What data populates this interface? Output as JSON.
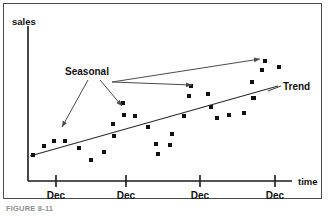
{
  "figure": {
    "caption": "FIGURE 8-11",
    "border_color": "#4a4a4a",
    "background_color": "#ffffff"
  },
  "chart_data": {
    "type": "scatter",
    "title": "",
    "xlabel": "time",
    "ylabel": "sales",
    "grid": false,
    "legend": "none",
    "axis": {
      "origin_px": [
        28,
        181
      ],
      "x_end_px": [
        292,
        181
      ],
      "y_end_px": [
        28,
        26
      ],
      "xlim_px": [
        28,
        292
      ],
      "ylim_px": [
        181,
        26
      ]
    },
    "xtick_labels": [
      "Dec",
      "Dec",
      "Dec",
      "Dec"
    ],
    "xtick_positions_px": [
      56,
      126,
      200,
      275
    ],
    "point_color": "#111111",
    "point_size_px": 4,
    "points": [
      [
        33,
        155
      ],
      [
        44,
        146
      ],
      [
        54,
        141
      ],
      [
        65,
        141
      ],
      [
        79,
        148
      ],
      [
        91,
        160
      ],
      [
        104,
        152
      ],
      [
        114,
        136
      ],
      [
        113,
        124
      ],
      [
        124,
        115
      ],
      [
        123,
        103
      ],
      [
        135,
        116
      ],
      [
        148,
        127
      ],
      [
        156,
        144
      ],
      [
        158,
        154
      ],
      [
        170,
        145
      ],
      [
        172,
        134
      ],
      [
        184,
        116
      ],
      [
        189,
        96
      ],
      [
        191,
        86
      ],
      [
        208,
        94
      ],
      [
        211,
        107
      ],
      [
        217,
        118
      ],
      [
        229,
        115
      ],
      [
        244,
        113
      ],
      [
        254,
        98
      ],
      [
        252,
        82
      ],
      [
        253,
        98
      ],
      [
        265,
        61
      ],
      [
        262,
        70
      ],
      [
        279,
        67
      ]
    ],
    "trend": {
      "label": "Trend",
      "label_px": [
        283,
        90
      ],
      "start_px": [
        30,
        156
      ],
      "end_px": [
        278,
        86
      ],
      "color": "#2b2b2b"
    },
    "annotations": [
      {
        "label": "Seasonal",
        "label_px": [
          87,
          75
        ],
        "color": "#4a4a4a",
        "arrows": [
          {
            "from_px": [
              88,
              80
            ],
            "to_px": [
              62,
              127
            ]
          },
          {
            "from_px": [
              100,
              80
            ],
            "to_px": [
              122,
              106
            ]
          },
          {
            "from_px": [
              112,
              82
            ],
            "to_px": [
              192,
              85
            ]
          },
          {
            "from_px": [
              112,
              82
            ],
            "to_px": [
              260,
              59
            ]
          }
        ]
      }
    ]
  }
}
